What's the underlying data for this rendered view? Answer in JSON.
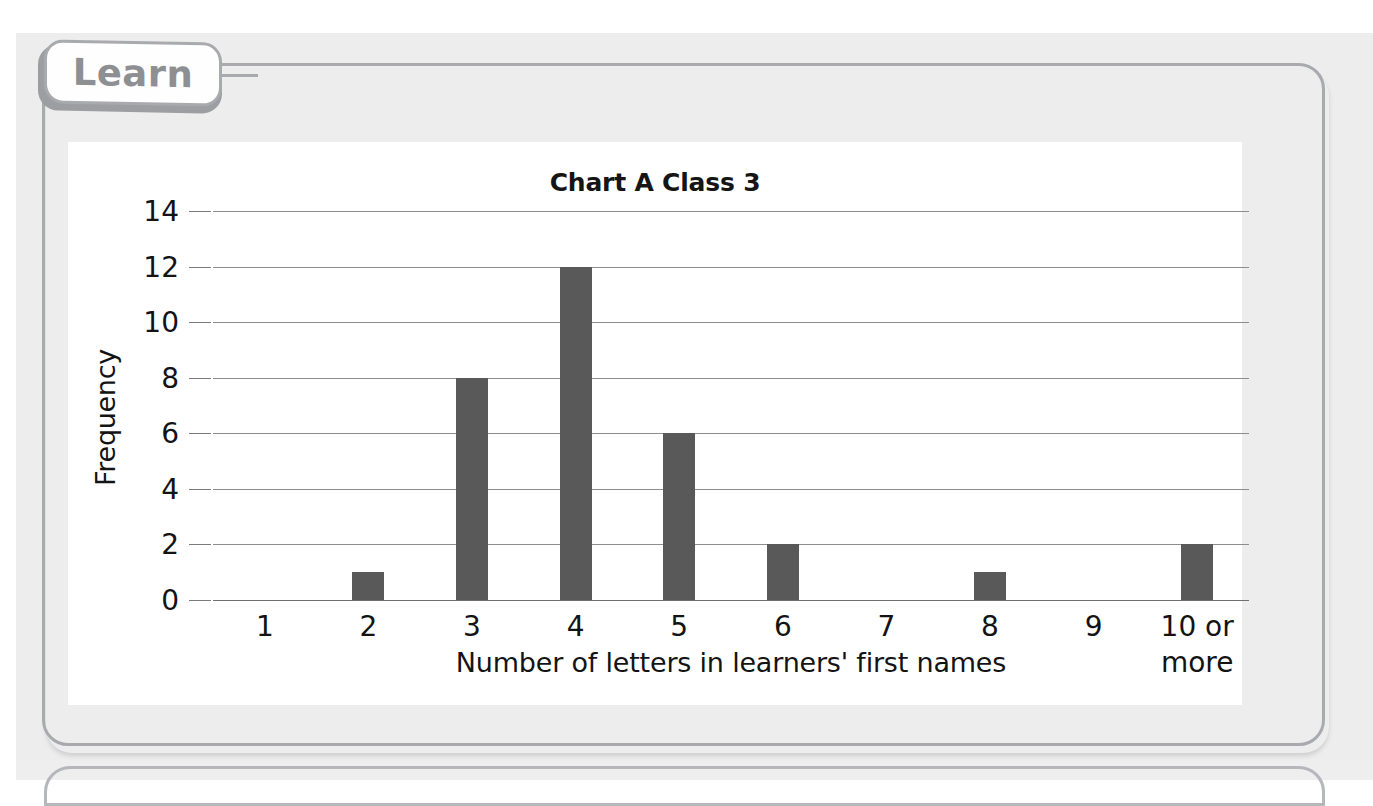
{
  "worksheet": {
    "tab_label": "Learn"
  },
  "chart_data": {
    "type": "bar",
    "title": "Chart A Class 3",
    "xlabel": "Number of letters in learners' first names",
    "ylabel": "Frequency",
    "categories": [
      "1",
      "2",
      "3",
      "4",
      "5",
      "6",
      "7",
      "8",
      "9",
      "10 or more"
    ],
    "values": [
      0,
      1,
      8,
      12,
      6,
      2,
      0,
      1,
      0,
      2
    ],
    "ylim": [
      0,
      14
    ],
    "ytick_labels": [
      "0",
      "2",
      "4",
      "6",
      "8",
      "10",
      "12",
      "14"
    ],
    "ytick_values": [
      0,
      2,
      4,
      6,
      8,
      10,
      12,
      14
    ],
    "ystep": 2,
    "grid": true,
    "legend": false,
    "bar_color": "#595959",
    "gridline_color": "#8d8d8d",
    "axis_color": "#6f6f6f",
    "text_color": "#131313"
  },
  "theme": {
    "page_background": "#ededee",
    "panel_border": "#a9aaad",
    "card_background": "#ffffff",
    "tab_text_color": "#8e8f93"
  }
}
